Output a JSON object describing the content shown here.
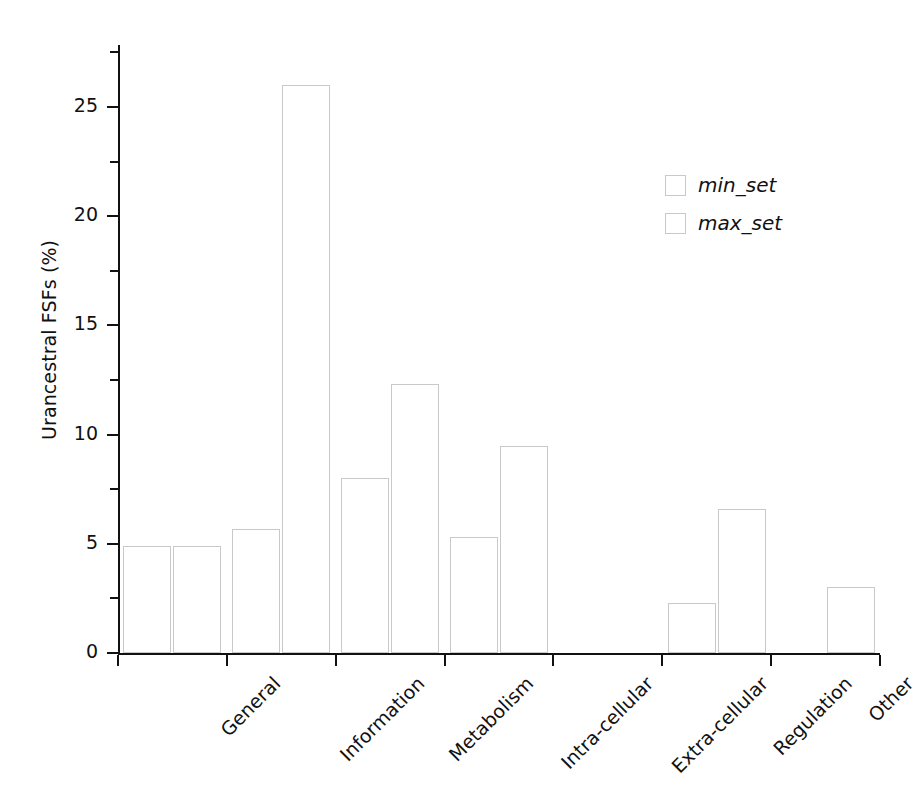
{
  "chart_data": {
    "type": "bar",
    "title": "",
    "xlabel": "",
    "ylabel": "Urancestral FSFs (%)",
    "categories": [
      "General",
      "Information",
      "Metabolism",
      "Intra-cellular",
      "Extra-cellular",
      "Regulation",
      "Other"
    ],
    "series": [
      {
        "name": "min_set",
        "values": [
          4.9,
          5.7,
          8.0,
          5.3,
          0.0,
          2.3,
          0.0
        ]
      },
      {
        "name": "max_set",
        "values": [
          4.9,
          26.0,
          12.3,
          9.5,
          0.0,
          6.6,
          3.0
        ]
      }
    ],
    "ylim": [
      0,
      27.5
    ],
    "y_major_ticks": [
      "0",
      "5",
      "10",
      "15",
      "20",
      "25"
    ],
    "y_minor_ticks": [
      2.5,
      7.5,
      12.5,
      17.5,
      22.5,
      27.5
    ],
    "grid": false,
    "legend_position": "upper-right",
    "bar_style": "outlined",
    "bar_edge_color": "#c9c9c9",
    "bar_fill_color": "none",
    "axis_color": "#111111"
  },
  "legend": {
    "entries": [
      {
        "label": "min_set"
      },
      {
        "label": "max_set"
      }
    ]
  },
  "axis": {
    "y_title": "Urancestral FSFs (%)",
    "y_tick_labels": [
      "25",
      "20",
      "15",
      "10",
      "5",
      "0"
    ],
    "x_tick_labels": [
      "General",
      "Information",
      "Metabolism",
      "Intra-cellular",
      "Extra-cellular",
      "Regulation",
      "Other"
    ]
  }
}
